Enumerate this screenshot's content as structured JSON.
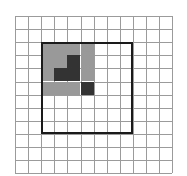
{
  "figure": {
    "background_color": "#ffffff"
  },
  "grid": {
    "name": "square-lattice",
    "columns": 12,
    "rows": 12,
    "cell_size_px": 13.1,
    "origin_x_px": 15,
    "origin_y_px": 16,
    "line_color": "#9b9b9b",
    "line_width_px": 1,
    "visible": true
  },
  "outline_rectangle": {
    "name": "bounding-square",
    "stroke_color": "#1a1a1a",
    "stroke_width_px": 2,
    "fill": "none",
    "grid_col_start": 2,
    "grid_row_start": 2,
    "grid_col_span": 7,
    "grid_row_span": 7,
    "x_px": 41,
    "y_px": 42,
    "width_px": 92,
    "height_px": 92
  },
  "shaded_block": {
    "name": "shaded-polyomino",
    "grid_col_start": 2,
    "grid_row_start": 2,
    "columns": 4,
    "rows": 4,
    "gray_color": "#999999",
    "dark_color": "#333333",
    "empty_color": "#ffffff",
    "legend": {
      "gray_label": "gray",
      "dark_label": "dark",
      "empty_label": "empty"
    },
    "matrix": [
      [
        "gray",
        "gray",
        "gray",
        "gray"
      ],
      [
        "gray",
        "gray",
        "dark",
        "gray"
      ],
      [
        "gray",
        "dark",
        "dark",
        "gray"
      ],
      [
        "gray",
        "gray",
        "gray",
        "dark"
      ]
    ],
    "gray_count": 12,
    "dark_count": 4
  }
}
